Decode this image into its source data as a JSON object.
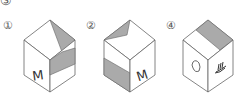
{
  "question_number": "③",
  "options": [
    {
      "label": "①",
      "left_face_symbol": "M",
      "right_face_symbol": "",
      "top_face": "diagonal shaded triangle",
      "right_face": "lower-upper band shaded"
    },
    {
      "label": "②",
      "left_face_symbol": "",
      "right_face_symbol": "M",
      "top_face": "diagonal shaded triangle",
      "left_face": "lower band shaded"
    },
    {
      "label": "④",
      "left_face_symbol": "heart-like shape",
      "right_face_symbol": "hand-like shape",
      "top_face": "half shaded band"
    }
  ],
  "colors": {
    "line": "#666666",
    "shade": "#aaaaaa",
    "background": "#ffffff"
  }
}
